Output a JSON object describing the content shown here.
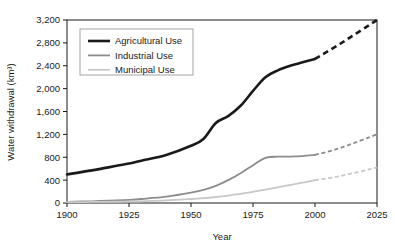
{
  "chart_data": {
    "type": "line",
    "title": "",
    "xlabel": "Year",
    "ylabel": "Water withdrawal (km3)",
    "ylabel_display": "Water withdrawal (km³)",
    "xlim": [
      1900,
      2025
    ],
    "ylim": [
      0,
      3200
    ],
    "xticks": [
      1900,
      1925,
      1950,
      1975,
      2000,
      2025
    ],
    "xtick_labels": [
      "1900",
      "1925",
      "1950",
      "1975",
      "2000",
      "2025"
    ],
    "yticks": [
      0,
      400,
      800,
      1200,
      1600,
      2000,
      2400,
      2800,
      3200
    ],
    "ytick_labels": [
      "0",
      "400",
      "800",
      "1,200",
      "1,600",
      "2,000",
      "2,400",
      "2,800",
      "3,200"
    ],
    "grid": false,
    "legend_position": "top-left",
    "projection_start_year": 2000,
    "series": [
      {
        "name": "Agricultural Use",
        "color": "#1a1a1a",
        "width": 2.6,
        "x": [
          1900,
          1910,
          1920,
          1925,
          1930,
          1940,
          1950,
          1955,
          1960,
          1965,
          1970,
          1975,
          1980,
          1985,
          1990,
          1995,
          2000
        ],
        "values": [
          500,
          570,
          650,
          690,
          740,
          840,
          1000,
          1120,
          1400,
          1520,
          1700,
          1960,
          2200,
          2320,
          2400,
          2460,
          2520
        ],
        "projection_x": [
          2000,
          2010,
          2025
        ],
        "projection_values": [
          2520,
          2780,
          3200
        ]
      },
      {
        "name": "Industrial Use",
        "color": "#8c8c8c",
        "width": 1.8,
        "x": [
          1900,
          1910,
          1920,
          1925,
          1930,
          1940,
          1950,
          1955,
          1960,
          1965,
          1970,
          1975,
          1980,
          1985,
          1990,
          1995,
          2000
        ],
        "values": [
          20,
          30,
          45,
          55,
          70,
          110,
          180,
          230,
          300,
          400,
          520,
          660,
          790,
          810,
          810,
          820,
          840
        ],
        "projection_x": [
          2000,
          2010,
          2025
        ],
        "projection_values": [
          840,
          960,
          1200
        ]
      },
      {
        "name": "Municipal Use",
        "color": "#c8c8c8",
        "width": 1.8,
        "x": [
          1900,
          1910,
          1920,
          1925,
          1930,
          1940,
          1950,
          1955,
          1960,
          1965,
          1970,
          1975,
          1980,
          1985,
          1990,
          1995,
          2000
        ],
        "values": [
          15,
          18,
          22,
          25,
          30,
          45,
          70,
          85,
          105,
          130,
          160,
          195,
          235,
          275,
          315,
          355,
          400
        ],
        "projection_x": [
          2000,
          2010,
          2025
        ],
        "projection_values": [
          400,
          470,
          620
        ]
      }
    ]
  },
  "legend": {
    "items": [
      {
        "label": "Agricultural Use"
      },
      {
        "label": "Industrial Use"
      },
      {
        "label": "Municipal Use"
      }
    ]
  }
}
